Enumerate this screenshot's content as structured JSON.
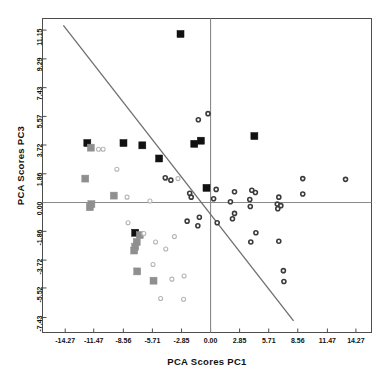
{
  "chart_data": {
    "type": "scatter",
    "title": "",
    "xlabel": "PCA Scores PC1",
    "ylabel": "PCA Scores PC3",
    "xlim": [
      -16.5,
      15.8
    ],
    "ylim": [
      -8.4,
      11.9
    ],
    "grid": false,
    "legend": null,
    "xticks": [
      "-14.27",
      "-11.47",
      "-8.56",
      "-5.71",
      "-2.85",
      "0.00",
      "2.85",
      "5.71",
      "8.56",
      "11.47",
      "14.27"
    ],
    "xtick_values": [
      -14.27,
      -11.47,
      -8.56,
      -5.71,
      -2.85,
      0.0,
      2.85,
      5.71,
      8.56,
      11.47,
      14.27
    ],
    "yticks": [
      "11.15",
      "9.29",
      "7.43",
      "5.57",
      "3.72",
      "1.86",
      "0.00",
      "-1.86",
      "-3.72",
      "-5.52",
      "-7.43"
    ],
    "ytick_values": [
      11.15,
      9.29,
      7.43,
      5.57,
      3.72,
      1.86,
      0.0,
      -1.86,
      -3.72,
      -5.52,
      -7.43
    ],
    "reference_lines": [
      {
        "name": "x-zero-line",
        "type": "vertical",
        "value": 0.0,
        "color": "#8a8a8a"
      },
      {
        "name": "y-zero-line",
        "type": "horizontal",
        "value": 0.0,
        "color": "#8a8a8a"
      },
      {
        "name": "discriminant-line",
        "type": "segment",
        "x0": -14.45,
        "y0": 11.45,
        "x1": 8.15,
        "y1": -7.65,
        "color": "#6e6e6e"
      }
    ],
    "series": [
      {
        "name": "black-squares",
        "marker": "filled-square",
        "color": "#111111",
        "size": 7,
        "points": [
          [
            -2.95,
            10.9
          ],
          [
            4.3,
            4.3
          ],
          [
            -12.1,
            3.85
          ],
          [
            -8.55,
            3.85
          ],
          [
            -6.7,
            3.7
          ],
          [
            -1.6,
            3.8
          ],
          [
            -0.95,
            4.0
          ],
          [
            -5.05,
            2.85
          ],
          [
            -0.4,
            0.95
          ],
          [
            -7.4,
            -1.95
          ]
        ]
      },
      {
        "name": "gray-squares",
        "marker": "filled-square",
        "color": "#8f8f8f",
        "size": 7,
        "points": [
          [
            -11.75,
            3.55
          ],
          [
            -12.3,
            1.55
          ],
          [
            -9.5,
            0.45
          ],
          [
            -11.7,
            -0.1
          ],
          [
            -11.85,
            -0.3
          ],
          [
            -6.95,
            -2.1
          ],
          [
            -7.25,
            -2.55
          ],
          [
            -7.4,
            -2.85
          ],
          [
            -7.5,
            -3.1
          ],
          [
            -7.2,
            -4.45
          ],
          [
            -5.6,
            -5.05
          ]
        ]
      },
      {
        "name": "open-light-circles",
        "marker": "open-circle",
        "color": "#b5b5b5",
        "size": 4,
        "points": [
          [
            -11.0,
            3.45
          ],
          [
            -10.55,
            3.45
          ],
          [
            -9.2,
            2.15
          ],
          [
            -4.4,
            1.55
          ],
          [
            -3.2,
            1.55
          ],
          [
            -8.2,
            0.35
          ],
          [
            -5.95,
            0.1
          ],
          [
            -8.1,
            -1.3
          ],
          [
            -6.55,
            -2.0
          ],
          [
            -5.4,
            -2.55
          ],
          [
            -4.4,
            -3.0
          ],
          [
            -5.65,
            -4.0
          ],
          [
            -3.8,
            -4.95
          ],
          [
            -4.9,
            -6.2
          ],
          [
            -2.65,
            -6.25
          ],
          [
            -2.6,
            -4.75
          ],
          [
            -3.55,
            -2.2
          ]
        ]
      },
      {
        "name": "dark-rings",
        "marker": "ring",
        "color": "#3b3b3b",
        "size": 4,
        "points": [
          [
            -0.25,
            5.75
          ],
          [
            -1.2,
            5.35
          ],
          [
            -4.45,
            1.6
          ],
          [
            -3.9,
            1.45
          ],
          [
            -2.05,
            0.6
          ],
          [
            -1.9,
            0.35
          ],
          [
            0.55,
            0.85
          ],
          [
            0.3,
            0.25
          ],
          [
            2.35,
            0.7
          ],
          [
            4.05,
            0.8
          ],
          [
            4.4,
            0.65
          ],
          [
            1.95,
            0.05
          ],
          [
            3.85,
            0.2
          ],
          [
            3.9,
            -0.25
          ],
          [
            6.7,
            0.35
          ],
          [
            6.55,
            -0.1
          ],
          [
            6.9,
            -0.2
          ],
          [
            6.6,
            -0.4
          ],
          [
            9.05,
            1.55
          ],
          [
            13.25,
            1.5
          ],
          [
            9.05,
            0.55
          ],
          [
            2.35,
            -0.7
          ],
          [
            2.15,
            -1.05
          ],
          [
            0.65,
            -1.3
          ],
          [
            -2.3,
            -1.2
          ],
          [
            -1.25,
            -1.5
          ],
          [
            4.45,
            -1.95
          ],
          [
            3.95,
            -2.55
          ],
          [
            6.7,
            -2.5
          ],
          [
            7.15,
            -4.4
          ],
          [
            7.2,
            -5.1
          ],
          [
            -1.1,
            -0.95
          ]
        ]
      }
    ]
  },
  "axes": {
    "x_title": "PCA Scores PC1",
    "y_title": "PCA Scores PC3"
  }
}
